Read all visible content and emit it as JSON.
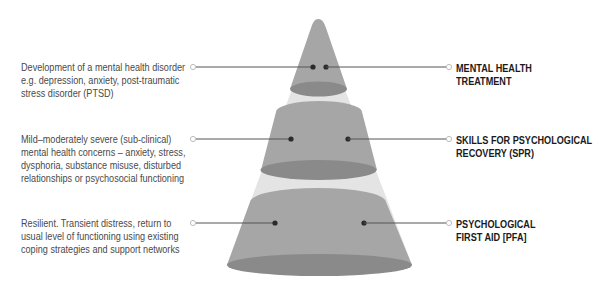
{
  "diagram": {
    "type": "tiered-cone",
    "colors": {
      "segment_fill": "#a6a6a6",
      "segment_ellipse": "#8a8a8a",
      "gap_fill": "#e4e4e4",
      "connector_line": "#555555",
      "dot": "#2b2b2b",
      "desc_text": "#4a4a4a",
      "label_text": "#1a1a1a"
    },
    "tiers": [
      {
        "level": "top",
        "label_lines": [
          "MENTAL HEALTH",
          "TREATMENT"
        ],
        "description_lines": [
          "Development of a mental health disorder",
          "e.g. depression, anxiety, post-traumatic",
          "stress disorder (PTSD)"
        ]
      },
      {
        "level": "middle",
        "label_lines": [
          "SKILLS FOR PSYCHOLOGICAL",
          "RECOVERY (SPR)"
        ],
        "description_lines": [
          "Mild–moderately severe (sub-clinical)",
          "mental health concerns – anxiety, stress,",
          "dysphoria, substance misuse, disturbed",
          "relationships or psychosocial functioning"
        ]
      },
      {
        "level": "bottom",
        "label_lines": [
          "PSYCHOLOGICAL",
          "FIRST AID [PFA]"
        ],
        "description_lines": [
          "Resilient. Transient distress, return to",
          "usual level of functioning using existing",
          "coping strategies and support networks"
        ]
      }
    ]
  }
}
